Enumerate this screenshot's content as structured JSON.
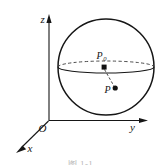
{
  "figure": {
    "background_color": "#ffffff",
    "stroke_color": "#161616",
    "dashed_color": "#3a3a3a",
    "axes": {
      "z_label": "z",
      "y_label": "y",
      "x_label": "x",
      "origin_label": "O"
    },
    "points": [
      {
        "id": "p0",
        "label": "P",
        "subscript": "0",
        "marker": "filled-square",
        "description": "center point on the equatorial plane"
      },
      {
        "id": "p",
        "label": "P",
        "subscript": "",
        "marker": "filled-dot",
        "description": "interior point below the equatorial plane"
      }
    ],
    "sphere": {
      "center_x": 106,
      "center_y": 67,
      "radius": 48,
      "equator_rx": 48,
      "equator_ry": 6,
      "back_arc_style": "dashed",
      "front_arc_style": "solid"
    },
    "connector": {
      "style": "dashed",
      "from": "p0",
      "to": "p"
    },
    "caption": "图 1-1"
  }
}
